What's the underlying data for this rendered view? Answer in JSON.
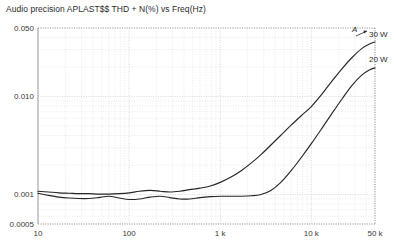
{
  "chart_title": "Audio precision APLAST$$ THD + N(%) vs Freq(Hz)",
  "annotation_a": "A",
  "axes": {
    "y_ticks": [
      "0.050",
      "0.010",
      "0.001",
      "0.0005"
    ],
    "x_ticks": [
      "10",
      "100",
      "1 k",
      "10 k",
      "50 k"
    ]
  },
  "series_labels": {
    "s30": "30 W",
    "s20": "20 W"
  },
  "colors": {
    "trace": "#262626",
    "grid": "#c9c9c9",
    "grid_minor": "#dcdcdc",
    "axis": "#8c8c8c",
    "text": "#2b2b2b",
    "background": "#ffffff"
  },
  "chart_data": {
    "type": "line",
    "title": "Audio precision APLAST$$ THD + N(%) vs Freq(Hz)",
    "xlabel": "Freq(Hz)",
    "ylabel": "THD + N(%)",
    "xscale": "log",
    "yscale": "log",
    "xlim": [
      10,
      50000
    ],
    "ylim": [
      0.0005,
      0.05
    ],
    "grid": true,
    "legend": "inline-right",
    "xticks": [
      10,
      100,
      1000,
      10000,
      50000
    ],
    "xticklabels": [
      "10",
      "100",
      "1 k",
      "10 k",
      "50 k"
    ],
    "yticks": [
      0.0005,
      0.001,
      0.01,
      0.05
    ],
    "yticklabels": [
      "0.0005",
      "0.001",
      "0.010",
      "0.050"
    ],
    "series": [
      {
        "name": "30 W",
        "x": [
          10,
          13,
          17,
          22,
          28,
          36,
          46,
          60,
          78,
          100,
          130,
          170,
          220,
          280,
          360,
          460,
          600,
          780,
          1000,
          1300,
          1700,
          2200,
          2800,
          3600,
          4600,
          6000,
          7800,
          10000,
          13000,
          17000,
          22000,
          28000,
          36000,
          44000,
          50000
        ],
        "y": [
          0.00108,
          0.00106,
          0.00104,
          0.00103,
          0.00102,
          0.00102,
          0.00101,
          0.00101,
          0.00102,
          0.00104,
          0.00108,
          0.0011,
          0.00108,
          0.00106,
          0.00108,
          0.00112,
          0.00116,
          0.00122,
          0.00133,
          0.0015,
          0.00175,
          0.0021,
          0.00255,
          0.0032,
          0.004,
          0.0051,
          0.0064,
          0.0079,
          0.0105,
          0.0145,
          0.0195,
          0.025,
          0.031,
          0.0345,
          0.036
        ]
      },
      {
        "name": "20 W",
        "x": [
          10,
          13,
          17,
          22,
          28,
          36,
          46,
          60,
          78,
          100,
          130,
          170,
          220,
          280,
          360,
          460,
          600,
          780,
          1000,
          1300,
          1700,
          2200,
          2800,
          3600,
          4600,
          6000,
          7800,
          10000,
          13000,
          17000,
          22000,
          28000,
          36000,
          44000,
          50000
        ],
        "y": [
          0.00103,
          0.00098,
          0.00094,
          0.00092,
          0.00091,
          0.00091,
          0.00093,
          0.00096,
          0.00092,
          0.00089,
          0.0009,
          0.00094,
          0.00096,
          0.00093,
          0.0009,
          0.0009,
          0.00093,
          0.00095,
          0.00096,
          0.00096,
          0.00096,
          0.00097,
          0.001,
          0.0011,
          0.00132,
          0.00175,
          0.0024,
          0.0033,
          0.0047,
          0.0068,
          0.0096,
          0.013,
          0.0166,
          0.0188,
          0.0196
        ]
      }
    ]
  }
}
